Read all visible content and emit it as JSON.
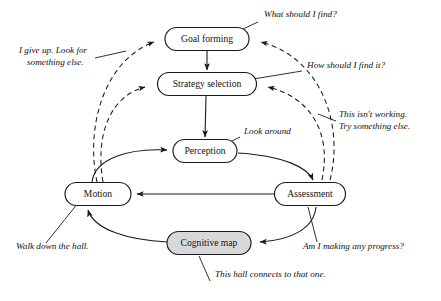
{
  "diagram": {
    "type": "flow-diagram",
    "background_color": "#ffffff",
    "line_color": "#1a1a1a",
    "shaded_fill_color": "#d8d8d8",
    "plain_fill_color": "#ffffff",
    "nodes": [
      {
        "id": "goal_forming",
        "label": "Goal forming",
        "x": 207,
        "y": 39,
        "w": 84,
        "h": 23,
        "shaded": false
      },
      {
        "id": "strategy_selection",
        "label": "Strategy selection",
        "x": 207,
        "y": 84,
        "w": 99,
        "h": 23,
        "shaded": false
      },
      {
        "id": "perception",
        "label": "Perception",
        "x": 205,
        "y": 151,
        "w": 64,
        "h": 23,
        "shaded": false
      },
      {
        "id": "motion",
        "label": "Motion",
        "x": 98,
        "y": 194,
        "w": 66,
        "h": 23,
        "shaded": false
      },
      {
        "id": "assessment",
        "label": "Assessment",
        "x": 310,
        "y": 194,
        "w": 71,
        "h": 23,
        "shaded": false
      },
      {
        "id": "cognitive_map",
        "label": "Cognitive map",
        "x": 209,
        "y": 243,
        "w": 84,
        "h": 23,
        "shaded": true
      }
    ],
    "edges": [
      {
        "id": "goal-to-strategy",
        "from": "goal_forming",
        "to": "strategy_selection",
        "style": "solid",
        "arrow": true
      },
      {
        "id": "strategy-to-perception",
        "from": "strategy_selection",
        "to": "perception",
        "style": "solid",
        "arrow": true
      },
      {
        "id": "motion-to-perception",
        "from": "motion",
        "to": "perception",
        "style": "solid",
        "arrow": true
      },
      {
        "id": "perception-to-assessment",
        "from": "perception",
        "to": "assessment",
        "style": "solid",
        "arrow": true
      },
      {
        "id": "assessment-to-motion",
        "from": "assessment",
        "to": "motion",
        "style": "solid",
        "arrow": true
      },
      {
        "id": "assessment-to-cogmap",
        "from": "assessment",
        "to": "cognitive_map",
        "style": "solid",
        "arrow": true
      },
      {
        "id": "cogmap-to-motion",
        "from": "cognitive_map",
        "to": "motion",
        "style": "solid",
        "arrow": true
      },
      {
        "id": "motion-to-goal",
        "from": "motion",
        "to": "goal_forming",
        "style": "dashed",
        "arrow": true
      },
      {
        "id": "motion-to-strategy",
        "from": "motion",
        "to": "strategy_selection",
        "style": "dashed",
        "arrow": true
      },
      {
        "id": "assessment-to-goal",
        "from": "assessment",
        "to": "goal_forming",
        "style": "dashed",
        "arrow": true
      },
      {
        "id": "assessment-to-strategy",
        "from": "assessment",
        "to": "strategy_selection",
        "style": "dashed",
        "arrow": true
      }
    ],
    "annotations": [
      {
        "id": "ann-what-should-i-find",
        "lines": [
          "What should I find?"
        ],
        "attached_to": "goal_forming",
        "align": "start",
        "x": 264,
        "y": 17
      },
      {
        "id": "ann-i-give-up",
        "lines": [
          "I give up. Look for",
          "something else."
        ],
        "attached_to": "motion-to-goal",
        "align": "start",
        "x": 19,
        "y": 53
      },
      {
        "id": "ann-how-should-i-find-it",
        "lines": [
          "How should I find it?"
        ],
        "attached_to": "strategy_selection",
        "align": "start",
        "x": 307,
        "y": 68
      },
      {
        "id": "ann-this-isnt-working",
        "lines": [
          "This isn't working.",
          "Try something else."
        ],
        "attached_to": "assessment-to-strategy",
        "align": "start",
        "x": 339,
        "y": 117
      },
      {
        "id": "ann-look-around",
        "lines": [
          "Look around"
        ],
        "attached_to": "perception",
        "align": "start",
        "x": 244,
        "y": 134
      },
      {
        "id": "ann-walk-down-the-hall",
        "lines": [
          "Walk down the hall."
        ],
        "attached_to": "motion",
        "align": "start",
        "x": 16,
        "y": 249
      },
      {
        "id": "ann-am-i-making-progress",
        "lines": [
          "Am I making any progress?"
        ],
        "attached_to": "assessment",
        "align": "start",
        "x": 303,
        "y": 249
      },
      {
        "id": "ann-this-hall-connects",
        "lines": [
          "This hall connects to that one."
        ],
        "attached_to": "cognitive_map",
        "align": "start",
        "x": 215,
        "y": 277
      }
    ]
  }
}
